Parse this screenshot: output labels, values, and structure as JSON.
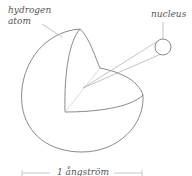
{
  "diagram": {
    "labels": {
      "atom_line1": "hydrogen",
      "atom_line2": "atom",
      "nucleus": "nucleus",
      "scale": "1 ångström"
    },
    "colors": {
      "stroke": "#8a8a8a",
      "text": "#555555",
      "background": "#ffffff"
    }
  }
}
